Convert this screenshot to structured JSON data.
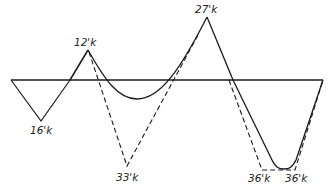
{
  "diagram": {
    "type": "moment-diagram",
    "colors": {
      "line": "#1a1a1a",
      "background": "#ffffff"
    },
    "baseline": {
      "y": 80,
      "x_start": 11,
      "x_end": 323
    },
    "labels": {
      "neg_left": "16'k",
      "pos_peak1": "12'k",
      "neg_dashed_mid": "33'k",
      "pos_peak2": "27'k",
      "neg_right_1": "36'k",
      "neg_right_2": "36'k"
    },
    "solid_curve_points": [
      [
        11,
        80
      ],
      [
        41,
        121
      ],
      [
        88,
        50
      ],
      [
        137,
        99
      ],
      [
        207,
        17
      ],
      [
        233,
        80
      ],
      [
        278,
        169
      ],
      [
        290,
        169
      ],
      [
        323,
        80
      ]
    ],
    "dashed_curve_points": [
      [
        88,
        50
      ],
      [
        127,
        166
      ],
      [
        191,
        80
      ],
      [
        207,
        17
      ],
      [
        233,
        80
      ],
      [
        262,
        170
      ],
      [
        295,
        170
      ],
      [
        323,
        80
      ]
    ],
    "legend": {
      "solid": "moment envelope (solid)",
      "dashed": "moment envelope (dashed)"
    }
  }
}
